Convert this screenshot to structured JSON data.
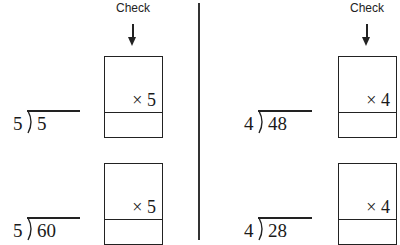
{
  "divider_color": "#333333",
  "left": {
    "check_label": "Check",
    "problems": [
      {
        "divisor": "5",
        "dividend": "5",
        "multiplier": "× 5"
      },
      {
        "divisor": "5",
        "dividend": "60",
        "multiplier": "× 5"
      }
    ]
  },
  "right": {
    "check_label": "Check",
    "problems": [
      {
        "divisor": "4",
        "dividend": "48",
        "multiplier": "× 4"
      },
      {
        "divisor": "4",
        "dividend": "28",
        "multiplier": "× 4"
      }
    ]
  }
}
